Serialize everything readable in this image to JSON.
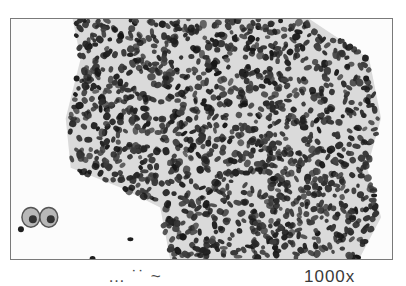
{
  "figure": {
    "color_mode": "grayscale",
    "frame": {
      "border_color": "#7a7a7a",
      "background": "#fcfcfc"
    },
    "colors": {
      "nucleus": "#1e1e1e",
      "cytoplasm": "#9a9a9a",
      "background": "#fcfcfc"
    },
    "cluster": {
      "outline": [
        [
          62,
          0
        ],
        [
          300,
          0
        ],
        [
          360,
          40
        ],
        [
          372,
          100
        ],
        [
          358,
          150
        ],
        [
          372,
          200
        ],
        [
          350,
          242
        ],
        [
          160,
          242
        ],
        [
          150,
          190
        ],
        [
          110,
          170
        ],
        [
          60,
          150
        ],
        [
          55,
          100
        ],
        [
          70,
          40
        ]
      ],
      "nucleus_count": 1400,
      "seed": 7
    },
    "isolated_cells": [
      {
        "x": 20,
        "y": 200,
        "rx": 9,
        "ry": 10,
        "type": "pale-cell"
      },
      {
        "x": 38,
        "y": 200,
        "rx": 9,
        "ry": 10,
        "type": "pale-cell"
      },
      {
        "x": 10,
        "y": 212,
        "rx": 3,
        "ry": 3,
        "type": "nucleus"
      },
      {
        "x": 82,
        "y": 242,
        "rx": 3,
        "ry": 3,
        "type": "nucleus"
      },
      {
        "x": 365,
        "y": 178,
        "rx": 3,
        "ry": 2,
        "type": "nucleus"
      },
      {
        "x": 357,
        "y": 60,
        "rx": 3,
        "ry": 3,
        "type": "nucleus"
      },
      {
        "x": 66,
        "y": 60,
        "rx": 3,
        "ry": 3,
        "type": "nucleus"
      },
      {
        "x": 120,
        "y": 222,
        "rx": 3,
        "ry": 2,
        "type": "nucleus"
      }
    ]
  },
  "caption": {
    "prefix": "… ˙˙ ~",
    "magnification": "1000x"
  }
}
